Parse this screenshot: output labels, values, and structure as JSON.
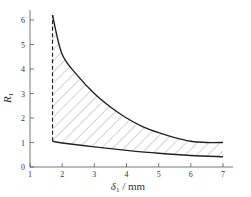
{
  "chart_data": {
    "type": "area",
    "title": "",
    "xlabel": "δ1 / mm",
    "xlabel_main": "δ",
    "xlabel_sub": "1",
    "xlabel_unit": " / mm",
    "ylabel": "R1",
    "ylabel_main": "R",
    "ylabel_sub": "1",
    "xlim": [
      1,
      7.3
    ],
    "ylim": [
      0,
      6.4
    ],
    "xticks": [
      1,
      2,
      3,
      4,
      5,
      6,
      7
    ],
    "yticks": [
      0,
      1,
      2,
      3,
      4,
      5,
      6
    ],
    "grid": false,
    "legend": null,
    "series": [
      {
        "name": "upper bound",
        "style": "solid",
        "x": [
          1.7,
          2.0,
          2.5,
          3.0,
          3.5,
          4.0,
          4.5,
          5.0,
          5.5,
          6.0,
          6.5,
          7.0
        ],
        "y": [
          6.2,
          4.6,
          3.7,
          3.0,
          2.45,
          2.0,
          1.65,
          1.4,
          1.2,
          1.05,
          1.0,
          1.0
        ]
      },
      {
        "name": "lower bound",
        "style": "solid",
        "x": [
          1.7,
          2.0,
          3.0,
          4.0,
          5.0,
          6.0,
          7.0
        ],
        "y": [
          1.05,
          0.98,
          0.82,
          0.68,
          0.56,
          0.47,
          0.42
        ]
      },
      {
        "name": "left limit",
        "style": "dashed",
        "x": [
          1.7,
          1.7
        ],
        "y": [
          1.05,
          6.2
        ]
      }
    ],
    "annotations": [
      {
        "type": "hatched-region",
        "between": [
          "lower bound",
          "upper bound"
        ],
        "x_range": [
          1.7,
          7.0
        ]
      }
    ]
  }
}
